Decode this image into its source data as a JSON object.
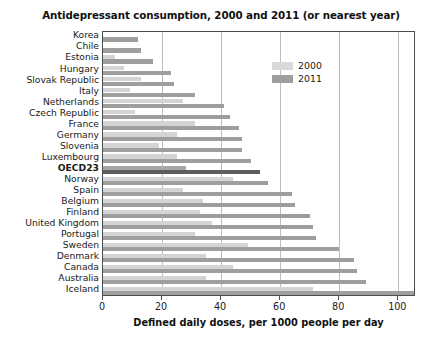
{
  "chart_data": {
    "type": "bar",
    "orientation": "horizontal",
    "title": "Antidepressant consumption, 2000 and 2011 (or nearest year)",
    "xlabel": "Defined daily doses, per 1000 people per day",
    "ylabel": "",
    "xlim": [
      0,
      106
    ],
    "xticks": [
      0,
      20,
      40,
      60,
      80,
      100
    ],
    "xticklabels": [
      "0",
      "20",
      "40",
      "60",
      "80",
      "100"
    ],
    "grid": "vertical",
    "legend_position": "upper right",
    "highlight_category": "OECD23",
    "colors": {
      "series_2000": "#d4d4d4",
      "series_2011": "#9e9e9e",
      "series_2000_highlight": "#a8a8a8",
      "series_2011_highlight": "#5e5e5e",
      "frame": "#4d4d4d",
      "gridline": "#bdbdbd",
      "background": "#ffffff"
    },
    "categories": [
      "Korea",
      "Chile",
      "Estonia",
      "Hungary",
      "Slovak Republic",
      "Italy",
      "Netherlands",
      "Czech Republic",
      "France",
      "Germany",
      "Slovenia",
      "Luxembourg",
      "OECD23",
      "Norway",
      "Spain",
      "Belgium",
      "Finland",
      "United Kingdom",
      "Portugal",
      "Sweden",
      "Denmark",
      "Canada",
      "Australia",
      "Iceland"
    ],
    "series": [
      {
        "name": "2000",
        "values": [
          0,
          0,
          4,
          7,
          13,
          9,
          27,
          11,
          31,
          25,
          19,
          25,
          28,
          44,
          27,
          34,
          33,
          37,
          31,
          49,
          35,
          44,
          35,
          71
        ]
      },
      {
        "name": "2011",
        "values": [
          12,
          13,
          17,
          23,
          24,
          31,
          41,
          43,
          46,
          47,
          47,
          50,
          53,
          56,
          64,
          65,
          70,
          71,
          72,
          80,
          85,
          86,
          89,
          106
        ]
      }
    ],
    "legend": [
      {
        "label": "2000",
        "color": "#d9d9d9"
      },
      {
        "label": "2011",
        "color": "#9e9e9e"
      }
    ]
  }
}
